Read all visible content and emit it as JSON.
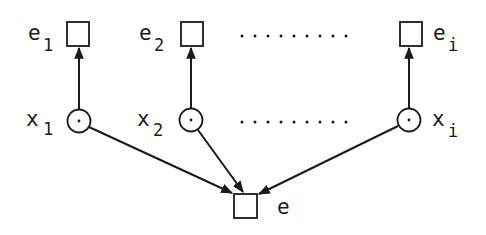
{
  "diagram": {
    "top_nodes": [
      {
        "id": "e1",
        "label": "e",
        "subscript": "1"
      },
      {
        "id": "e2",
        "label": "e",
        "subscript": "2"
      },
      {
        "id": "ei",
        "label": "e",
        "subscript": "i"
      }
    ],
    "middle_nodes": [
      {
        "id": "x1",
        "label": "x",
        "subscript": "1"
      },
      {
        "id": "x2",
        "label": "x",
        "subscript": "2"
      },
      {
        "id": "xi",
        "label": "x",
        "subscript": "i"
      }
    ],
    "bottom_node": {
      "id": "e",
      "label": "e"
    },
    "edges": [
      {
        "from": "x1",
        "to": "e1"
      },
      {
        "from": "x2",
        "to": "e2"
      },
      {
        "from": "xi",
        "to": "ei"
      },
      {
        "from": "x1",
        "to": "e"
      },
      {
        "from": "x2",
        "to": "e"
      },
      {
        "from": "xi",
        "to": "e"
      }
    ],
    "ellipsis": "..........",
    "colors": {
      "stroke": "#1a1a1a",
      "background": "#ffffff"
    }
  }
}
